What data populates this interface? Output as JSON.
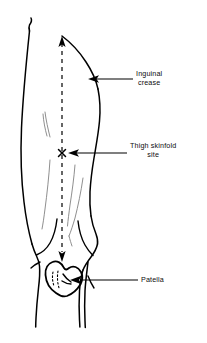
{
  "figure": {
    "name": "thigh-skinfold-site-diagram",
    "colors": {
      "ink": "#000000",
      "background": "#ffffff",
      "faint_ink": "#8a8a8a"
    },
    "annotations": [
      {
        "id": "inguinal-crease",
        "lines": [
          "Inguinal",
          "crease"
        ],
        "arrow": "points-left-to-thigh-outline"
      },
      {
        "id": "thigh-skinfold-site",
        "lines": [
          "Thigh skinfold",
          "site"
        ],
        "arrow": "points-left-to-x-marker"
      },
      {
        "id": "patella",
        "lines": [
          "Patella"
        ],
        "arrow": "points-left-to-kneecap"
      }
    ],
    "markers": {
      "midpoint_symbol": "X",
      "measurement_axis": "vertical-dashed-line-with-arrowheads"
    }
  }
}
